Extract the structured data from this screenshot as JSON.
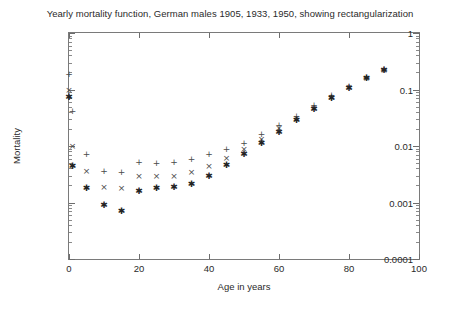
{
  "chart_data": {
    "type": "scatter",
    "title": "Yearly mortality function, German males 1905, 1933, 1950, showing rectangularization",
    "xlabel": "Age in years",
    "ylabel": "Mortality",
    "xlim": [
      0,
      100
    ],
    "ylim": [
      0.0001,
      1
    ],
    "yscale": "log",
    "xscale": "linear",
    "xticks": [
      0,
      20,
      40,
      60,
      80,
      100
    ],
    "xticklabels": [
      "0",
      "20",
      "40",
      "60",
      "80",
      "100"
    ],
    "yticks": [
      1,
      0.1,
      0.01,
      0.001,
      0.0001
    ],
    "yticklabels": [
      "1",
      "0.1",
      "0.01",
      "0.001",
      "0.0001"
    ],
    "grid": false,
    "legend": "none",
    "series": [
      {
        "name": "1905",
        "marker": "+",
        "glyph": "+",
        "color": "#4a4a4a",
        "points": [
          {
            "x": 0,
            "y": 0.185
          },
          {
            "x": 1,
            "y": 0.042
          },
          {
            "x": 5,
            "y": 0.0072
          },
          {
            "x": 10,
            "y": 0.0036
          },
          {
            "x": 15,
            "y": 0.0034
          },
          {
            "x": 20,
            "y": 0.0052
          },
          {
            "x": 25,
            "y": 0.005
          },
          {
            "x": 30,
            "y": 0.0052
          },
          {
            "x": 35,
            "y": 0.0058
          },
          {
            "x": 40,
            "y": 0.0072
          },
          {
            "x": 45,
            "y": 0.009
          },
          {
            "x": 50,
            "y": 0.0115
          },
          {
            "x": 55,
            "y": 0.016
          },
          {
            "x": 60,
            "y": 0.0235
          },
          {
            "x": 65,
            "y": 0.034
          },
          {
            "x": 70,
            "y": 0.053
          },
          {
            "x": 75,
            "y": 0.08
          },
          {
            "x": 80,
            "y": 0.115
          },
          {
            "x": 85,
            "y": 0.165
          },
          {
            "x": 90,
            "y": 0.23
          }
        ]
      },
      {
        "name": "1933",
        "marker": "x",
        "glyph": "×",
        "color": "#4a4a4a",
        "points": [
          {
            "x": 0,
            "y": 0.098
          },
          {
            "x": 1,
            "y": 0.01
          },
          {
            "x": 5,
            "y": 0.0036
          },
          {
            "x": 10,
            "y": 0.0019
          },
          {
            "x": 15,
            "y": 0.0018
          },
          {
            "x": 20,
            "y": 0.003
          },
          {
            "x": 25,
            "y": 0.0029
          },
          {
            "x": 30,
            "y": 0.003
          },
          {
            "x": 35,
            "y": 0.0034
          },
          {
            "x": 40,
            "y": 0.0044
          },
          {
            "x": 45,
            "y": 0.0062
          },
          {
            "x": 50,
            "y": 0.009
          },
          {
            "x": 55,
            "y": 0.0135
          },
          {
            "x": 60,
            "y": 0.0205
          },
          {
            "x": 65,
            "y": 0.031
          },
          {
            "x": 70,
            "y": 0.048
          },
          {
            "x": 75,
            "y": 0.074
          },
          {
            "x": 80,
            "y": 0.11
          },
          {
            "x": 85,
            "y": 0.16
          },
          {
            "x": 90,
            "y": 0.225
          }
        ]
      },
      {
        "name": "1950",
        "marker": "*",
        "glyph": "✱",
        "color": "#232323",
        "points": [
          {
            "x": 0,
            "y": 0.074
          },
          {
            "x": 1,
            "y": 0.0045
          },
          {
            "x": 5,
            "y": 0.0018
          },
          {
            "x": 10,
            "y": 0.00092
          },
          {
            "x": 15,
            "y": 0.00072
          },
          {
            "x": 20,
            "y": 0.0016
          },
          {
            "x": 25,
            "y": 0.0018
          },
          {
            "x": 30,
            "y": 0.0019
          },
          {
            "x": 35,
            "y": 0.0021
          },
          {
            "x": 40,
            "y": 0.003
          },
          {
            "x": 45,
            "y": 0.0046
          },
          {
            "x": 50,
            "y": 0.0072
          },
          {
            "x": 55,
            "y": 0.0115
          },
          {
            "x": 60,
            "y": 0.018
          },
          {
            "x": 65,
            "y": 0.029
          },
          {
            "x": 70,
            "y": 0.045
          },
          {
            "x": 75,
            "y": 0.072
          },
          {
            "x": 80,
            "y": 0.108
          },
          {
            "x": 85,
            "y": 0.16
          },
          {
            "x": 90,
            "y": 0.225
          }
        ]
      }
    ]
  }
}
